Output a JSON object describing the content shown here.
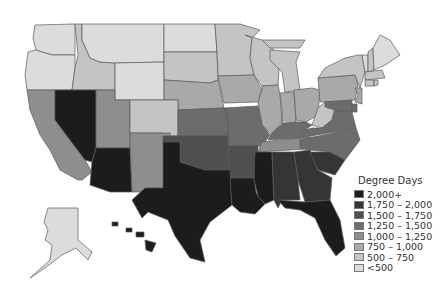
{
  "title": "Degree Days",
  "legend": {
    "title": "Degree Days",
    "items": [
      {
        "label": "2,000+",
        "color": "#1c1c1c"
      },
      {
        "label": "1,750 – 2,000",
        "color": "#353535"
      },
      {
        "label": "1,500 – 1,750",
        "color": "#4f4f4f"
      },
      {
        "label": "1,250 – 1,500",
        "color": "#6c6c6c"
      },
      {
        "label": "1,000 – 1,250",
        "color": "#8e8e8e"
      },
      {
        "label": "750 – 1,000",
        "color": "#a9a9a9"
      },
      {
        "label": "500 – 750",
        "color": "#c4c4c4"
      },
      {
        "label": "<500",
        "color": "#dcdcdc"
      }
    ]
  },
  "states": {
    "WA": 7,
    "OR": 7,
    "ID": 6,
    "MT": 7,
    "WY": 7,
    "ND": 7,
    "SD": 6,
    "NE": 5,
    "MN": 6,
    "WI": 6,
    "MI": 6,
    "IA": 5,
    "IL": 5,
    "IN": 5,
    "OH": 5,
    "PA": 5,
    "NY": 6,
    "VT": 7,
    "NH": 6,
    "ME": 7,
    "MA": 6,
    "CT": 6,
    "RI": 6,
    "NJ": 5,
    "CA": 4,
    "NV": 0,
    "UT": 4,
    "CO": 6,
    "AZ": 0,
    "NM": 4,
    "KS": 3,
    "MO": 3,
    "KY": 3,
    "WV": 6,
    "VA": 3,
    "MD": 3,
    "DE": 3,
    "OK": 2,
    "AR": 2,
    "TN": 4,
    "NC": 3,
    "TX": 0,
    "LA": 0,
    "MS": 0,
    "AL": 1,
    "GA": 1,
    "SC": 1,
    "FL": 0,
    "AK": 7,
    "HI": 0
  }
}
